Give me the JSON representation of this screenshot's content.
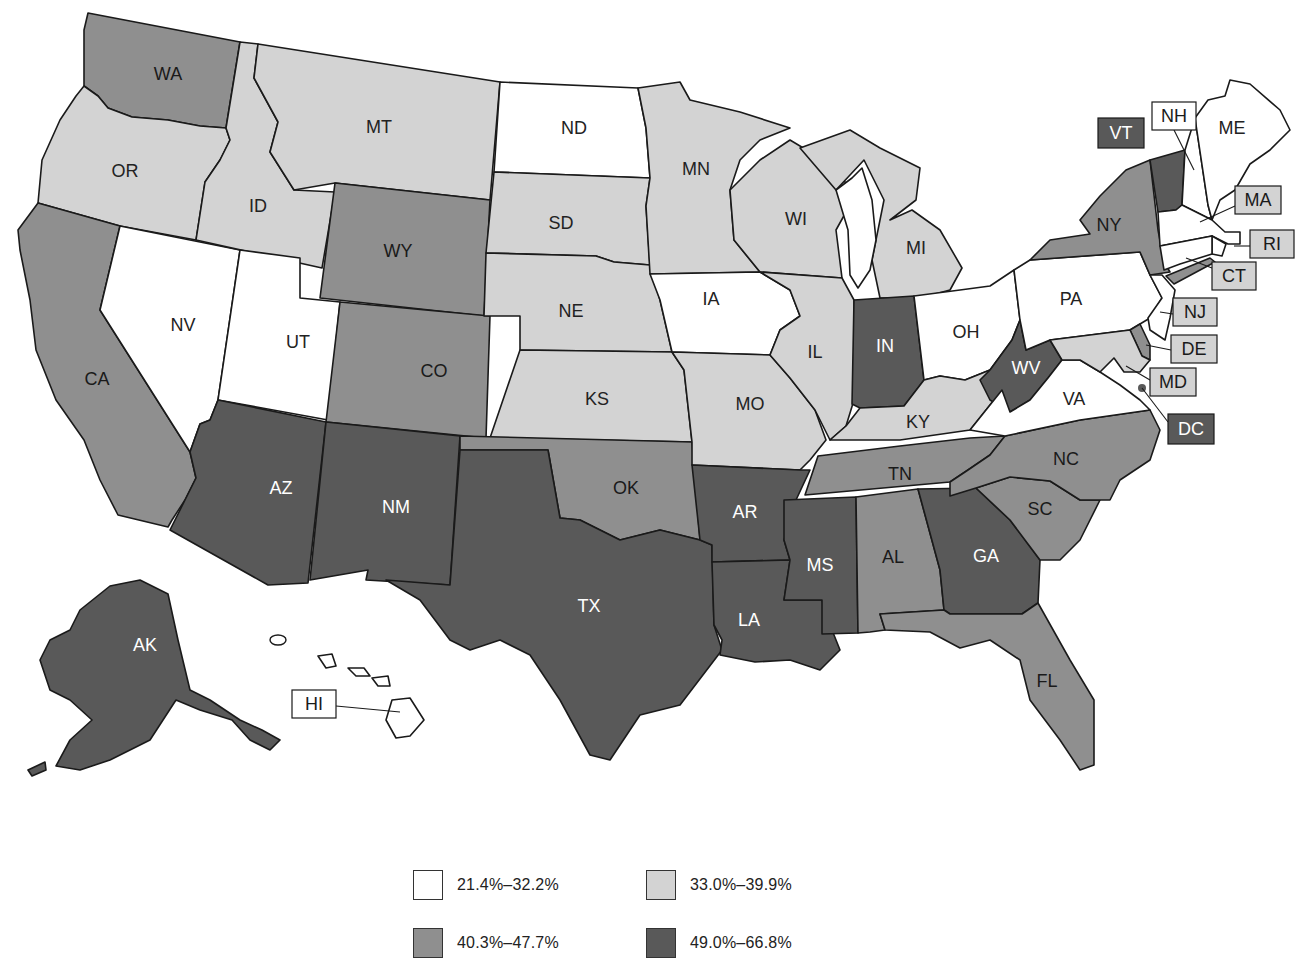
{
  "chart_data": {
    "type": "choropleth",
    "title": "",
    "legend": {
      "position": "bottom-center",
      "bins": [
        {
          "label": "21.4%–32.2%",
          "color": "#ffffff",
          "text_color": "#222222"
        },
        {
          "label": "33.0%–39.9%",
          "color": "#d3d3d3",
          "text_color": "#222222"
        },
        {
          "label": "40.3%–47.7%",
          "color": "#8f8f8f",
          "text_color": "#1a1a1a"
        },
        {
          "label": "49.0%–66.8%",
          "color": "#595959",
          "text_color": "#ffffff"
        }
      ]
    },
    "states": {
      "WA": 2,
      "OR": 1,
      "CA": 2,
      "NV": 0,
      "ID": 1,
      "MT": 1,
      "WY": 2,
      "UT": 0,
      "AZ": 3,
      "CO": 2,
      "NM": 3,
      "ND": 0,
      "SD": 1,
      "NE": 1,
      "KS": 1,
      "OK": 2,
      "TX": 3,
      "MN": 1,
      "IA": 0,
      "MO": 1,
      "AR": 3,
      "LA": 3,
      "WI": 1,
      "IL": 1,
      "MS": 3,
      "MI": 1,
      "IN": 3,
      "KY": 1,
      "TN": 2,
      "AL": 2,
      "OH": 0,
      "WV": 3,
      "GA": 3,
      "FL": 2,
      "SC": 2,
      "NC": 2,
      "VA": 0,
      "PA": 0,
      "NY": 2,
      "VT": 3,
      "NH": 0,
      "ME": 0,
      "MA": 0,
      "RI": 0,
      "CT": 0,
      "NJ": 0,
      "DE": 2,
      "MD": 1,
      "DC": 3,
      "AK": 3,
      "HI": 0
    }
  },
  "labels": {
    "WA": "WA",
    "OR": "OR",
    "CA": "CA",
    "NV": "NV",
    "ID": "ID",
    "MT": "MT",
    "WY": "WY",
    "UT": "UT",
    "AZ": "AZ",
    "CO": "CO",
    "NM": "NM",
    "ND": "ND",
    "SD": "SD",
    "NE": "NE",
    "KS": "KS",
    "OK": "OK",
    "TX": "TX",
    "MN": "MN",
    "IA": "IA",
    "MO": "MO",
    "AR": "AR",
    "LA": "LA",
    "WI": "WI",
    "IL": "IL",
    "MS": "MS",
    "MI": "MI",
    "IN": "IN",
    "KY": "KY",
    "TN": "TN",
    "AL": "AL",
    "OH": "OH",
    "WV": "WV",
    "GA": "GA",
    "FL": "FL",
    "SC": "SC",
    "NC": "NC",
    "VA": "VA",
    "PA": "PA",
    "NY": "NY",
    "VT": "VT",
    "NH": "NH",
    "ME": "ME",
    "MA": "MA",
    "RI": "RI",
    "CT": "CT",
    "NJ": "NJ",
    "DE": "DE",
    "MD": "MD",
    "DC": "DC",
    "AK": "AK",
    "HI": "HI"
  },
  "callout_box_colors": {
    "VT": "#595959",
    "NH": "#ffffff",
    "MA": "#d3d3d3",
    "RI": "#d3d3d3",
    "CT": "#d3d3d3",
    "NJ": "#d3d3d3",
    "DE": "#d3d3d3",
    "MD": "#d3d3d3",
    "DC": "#595959",
    "HI": "#ffffff"
  }
}
